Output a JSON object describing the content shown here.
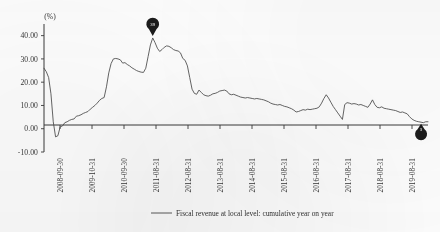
{
  "chart_data": {
    "type": "line",
    "title": "",
    "xlabel": "",
    "ylabel": "(%)",
    "unit_label": "(%)",
    "ylim": [
      -10,
      45
    ],
    "yticks": [
      40,
      30,
      20,
      10,
      0,
      -10
    ],
    "ytick_labels": [
      "40.00",
      "30.00",
      "20.00",
      "10.00",
      "0.00",
      "-10.00"
    ],
    "grid": false,
    "legend_position": "bottom-center",
    "legend": [
      "Fiscal revenue at local level: cumulative year on year"
    ],
    "xtick_labels": [
      "2008-09-30",
      "2009-10-31",
      "2010-09-30",
      "2011-08-31",
      "2012-08-31",
      "2013-08-31",
      "2014-08-31",
      "2015-08-31",
      "2016-08-31",
      "2017-08-31",
      "2018-08-31",
      "2019-08-31"
    ],
    "series": [
      {
        "name": "Fiscal revenue at local level: cumulative year on year",
        "color": "#4a4a4a",
        "values": [
          26.0,
          24.5,
          22.0,
          15.0,
          3.0,
          -3.5,
          -3.0,
          0.8,
          1.2,
          2.6,
          3.0,
          3.6,
          4.0,
          4.2,
          5.4,
          5.6,
          6.0,
          6.6,
          7.0,
          7.4,
          8.4,
          9.2,
          10.0,
          11.0,
          12.2,
          13.0,
          13.4,
          18.0,
          24.0,
          28.0,
          30.0,
          30.2,
          30.0,
          29.6,
          28.2,
          28.4,
          27.6,
          27.0,
          26.2,
          25.6,
          25.0,
          24.6,
          24.3,
          24.2,
          26.0,
          31.0,
          36.0,
          39.0,
          37.0,
          34.6,
          33.2,
          34.0,
          35.0,
          35.6,
          35.4,
          34.8,
          34.0,
          33.6,
          33.4,
          32.6,
          30.2,
          29.4,
          27.0,
          22.0,
          17.0,
          15.2,
          14.8,
          16.6,
          15.6,
          14.6,
          14.2,
          14.0,
          14.4,
          15.0,
          15.2,
          15.6,
          16.2,
          16.4,
          16.6,
          16.2,
          15.0,
          14.6,
          14.8,
          14.4,
          14.0,
          13.6,
          13.4,
          13.2,
          13.4,
          13.2,
          13.0,
          12.8,
          13.0,
          12.8,
          12.6,
          12.4,
          12.0,
          11.6,
          11.0,
          10.6,
          10.4,
          10.2,
          10.4,
          10.0,
          9.6,
          9.4,
          9.0,
          8.6,
          8.0,
          7.2,
          7.4,
          7.8,
          8.2,
          8.0,
          8.4,
          8.2,
          8.4,
          8.6,
          8.8,
          9.4,
          11.0,
          13.0,
          14.6,
          13.2,
          11.4,
          9.6,
          8.2,
          6.8,
          5.4,
          4.0,
          10.4,
          11.2,
          11.0,
          10.6,
          10.8,
          10.6,
          10.2,
          10.4,
          10.0,
          9.6,
          9.2,
          10.6,
          12.4,
          10.4,
          9.2,
          9.0,
          9.4,
          8.8,
          8.6,
          8.4,
          8.2,
          8.0,
          7.8,
          7.4,
          7.0,
          7.2,
          6.8,
          6.4,
          5.2,
          4.2,
          3.6,
          3.2,
          3.0,
          2.8,
          2.6,
          3.0,
          3.0
        ]
      }
    ],
    "annotations": [
      {
        "name": "peak-marker",
        "shape": "balloon-pin-up",
        "label": "39",
        "x_index": 47,
        "value": 39.0
      },
      {
        "name": "end-marker",
        "shape": "balloon-pin-down",
        "label": "3",
        "x_index": 163,
        "value": 3.0
      }
    ]
  }
}
